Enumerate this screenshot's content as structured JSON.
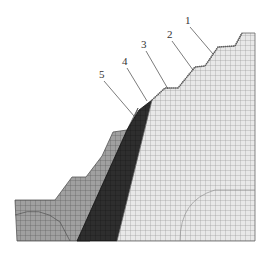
{
  "figure": {
    "type": "finite-element mesh of stepped slope",
    "colors": {
      "background": "#ffffff",
      "zone_outer": "#9a9a9a",
      "zone_dark": "#2e2e2e",
      "zone_main": "#e6e6e6",
      "mesh_line_light": "#8a8a8a",
      "mesh_line_dark": "#1a1a1a",
      "leader": "#444444"
    },
    "labels": [
      {
        "text": "1",
        "x": 188,
        "y": 25,
        "tx": 213,
        "ty": 54
      },
      {
        "text": "2",
        "x": 170,
        "y": 39,
        "tx": 193,
        "ty": 70
      },
      {
        "text": "3",
        "x": 143,
        "y": 49,
        "tx": 168,
        "ty": 89
      },
      {
        "text": "4",
        "x": 124,
        "y": 66,
        "tx": 147,
        "ty": 101
      },
      {
        "text": "5",
        "x": 101,
        "y": 79,
        "tx": 134,
        "ty": 116
      }
    ]
  }
}
